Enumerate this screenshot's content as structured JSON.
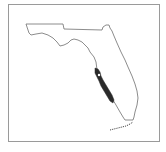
{
  "map": {
    "subject": "Florida",
    "description": "Outline map of Florida with a shaded distribution range along the southwest Gulf coast",
    "colors": {
      "outline": "#6e6e6e",
      "shaded_region": "#2a2a2a",
      "frame": "#9a9a9a",
      "background": "#ffffff"
    },
    "regions": [
      {
        "name": "state-outline",
        "label": ""
      },
      {
        "name": "shaded-range",
        "label": ""
      },
      {
        "name": "florida-keys",
        "label": ""
      }
    ]
  }
}
